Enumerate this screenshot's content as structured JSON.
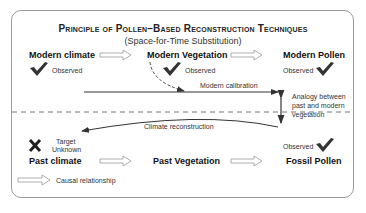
{
  "title": "Principle of Pollen–Based Reconstruction Techniques",
  "subtitle": "(Space-for-Time Substitution)",
  "top_row": {
    "modern_climate": "Modern climate",
    "modern_vegetation": "Modern Vegetation",
    "modern_pollen": "Modern Pollen",
    "observed_label": "Observed"
  },
  "middle": {
    "modern_calibration": "Modern calibration",
    "climate_reconstruction": "Climate reconstruction",
    "analogy_line1": "Analogy between",
    "analogy_line2": "past and modern",
    "analogy_line3": "vegetation"
  },
  "bottom_row": {
    "target_line1": "Target",
    "target_line2": "Unknown",
    "past_climate": "Past climate",
    "past_vegetation": "Past Vegetation",
    "fossil_pollen": "Fossil Pollen",
    "observed_label": "Observed"
  },
  "legend": {
    "causal_relationship": "Causal relationship"
  },
  "icons": {
    "check": "checkmark-icon",
    "cross": "x-icon",
    "hollow_arrow": "hollow-arrow-icon"
  },
  "colors": {
    "line": "#333333",
    "frame": "#9a9a9a",
    "hollow_arrow": "#999999"
  }
}
